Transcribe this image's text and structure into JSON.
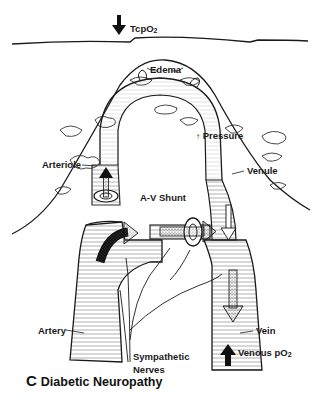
{
  "figure": {
    "panel_letter": "C",
    "title": "Diabetic Neuropathy"
  },
  "labels": {
    "tcpo2": {
      "text": "TcpO",
      "sub": "2",
      "indicator": "down-arrow"
    },
    "edema": "Edema",
    "pressure": {
      "indicator": "up-arrow",
      "text": "Pressure"
    },
    "arteriole": "Arteriole",
    "venule": "Venule",
    "av_shunt": "A-V Shunt",
    "artery": "Artery",
    "vein": "Vein",
    "venous_po2": {
      "text": "Venous pO",
      "sub": "2",
      "indicator": "up-arrow"
    },
    "sympathetic_nerves": [
      "Sympathetic",
      "Nerves"
    ]
  },
  "colors": {
    "ink": "#1a1a1a",
    "background": "#ffffff",
    "hatch": "#555555"
  }
}
